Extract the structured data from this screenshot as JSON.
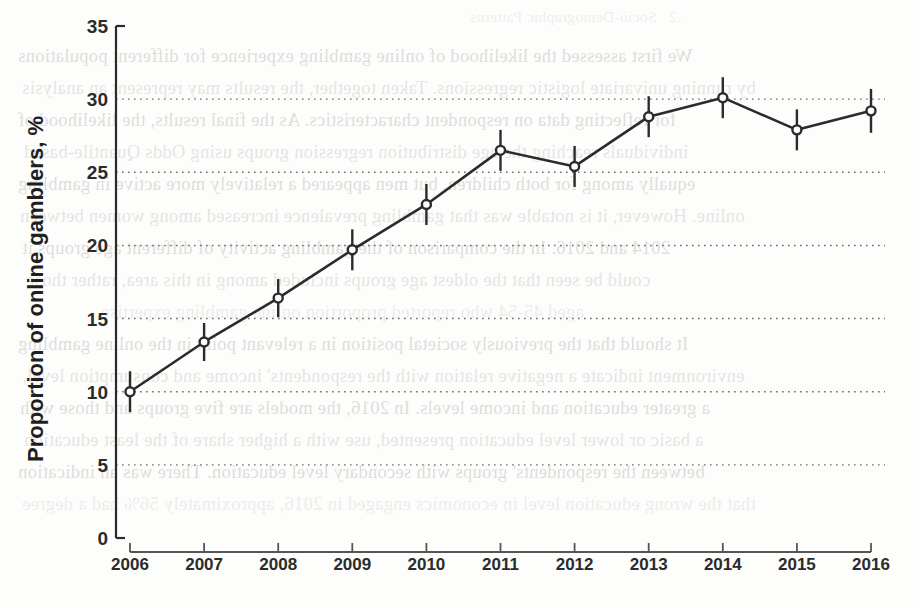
{
  "page": {
    "kind": "scanned-book-page",
    "background_color": "#fdfdfc",
    "ink_color": "#2b2b2b"
  },
  "bleed_through_text": {
    "note": "faint mirror-reversed show-through from the reverse side of the scanned page",
    "heading": ".2   Socio-Demographic Patterns",
    "lines": [
      "We first assessed the likelihood of online gambling experience for different populations",
      "by running univariate logistic regressions. Taken together, the results may represent an analysis",
      "for reflecting data on respondent characteristics. As the final results, the likelihood of",
      "individuals reaching the age distribution regression groups using Odds Quantile-based",
      "equally among for both children, but men appeared a relatively more active in gambling",
      "online. However, it is notable was that gambling prevalence increased among women between",
      "2014 and 2016. In the comparison of the gambling activity of different age groups it",
      "could be seen that the oldest age groups included among in this area, rather those",
      "aged 45-54 who reported proportion online gambling expertise.",
      "It should that the previously societal position in a relevant point in the online gambling",
      "environment indicate a negative relation with the respondents' income and consumption level,",
      "a greater education and income levels. In 2016, the models are five groups and those with",
      "a basic or lower level education presented, use with a higher share of the least education",
      "between the respondents' groups with secondary level education. There was an indication",
      "that the wrong education level in economics engaged in 2016, approximately 56% had a degree",
      "that the proportions who had participated in online gambling in relation to those with the"
    ]
  },
  "chart_data": {
    "type": "line",
    "title": "",
    "subtitle": "",
    "xlabel": "",
    "ylabel": "Proportion of online gamblers, %",
    "categories": [
      "2006",
      "2007",
      "2008",
      "2009",
      "2010",
      "2011",
      "2012",
      "2013",
      "2014",
      "2015",
      "2016"
    ],
    "x_tick_labels": [
      "2006",
      "2007",
      "2008",
      "2009",
      "2010",
      "2011",
      "2012",
      "2013",
      "2014",
      "2015",
      "2016"
    ],
    "y_tick_labels": [
      "0",
      "5",
      "10",
      "15",
      "20",
      "25",
      "30",
      "35"
    ],
    "y_ticks": [
      0,
      5,
      10,
      15,
      20,
      25,
      30,
      35
    ],
    "ylim": [
      0,
      35
    ],
    "values": [
      10.0,
      13.4,
      16.4,
      19.7,
      22.8,
      26.5,
      25.4,
      28.8,
      30.1,
      27.9,
      29.2
    ],
    "error_bars": {
      "shown": true,
      "style": "vertical-capless",
      "lower": [
        8.6,
        12.1,
        15.1,
        18.3,
        21.4,
        25.1,
        24.0,
        27.4,
        28.7,
        26.5,
        27.7
      ],
      "upper": [
        11.4,
        14.7,
        17.7,
        21.1,
        24.2,
        27.9,
        26.8,
        30.2,
        31.5,
        29.3,
        30.7
      ]
    },
    "series": [
      {
        "name": "Proportion of online gamblers",
        "values": [
          10.0,
          13.4,
          16.4,
          19.7,
          22.8,
          26.5,
          25.4,
          28.8,
          30.1,
          27.9,
          29.2
        ]
      }
    ],
    "grid": {
      "horizontal": true,
      "vertical": false,
      "style": "dotted",
      "at_values": [
        5,
        10,
        15,
        20,
        25,
        30
      ]
    },
    "legend": {
      "shown": false,
      "position": "none"
    },
    "marker": {
      "shape": "open-circle",
      "color": "#2b2b2b",
      "size": 9
    },
    "line": {
      "color": "#2b2b2b",
      "width": 2.6
    }
  }
}
